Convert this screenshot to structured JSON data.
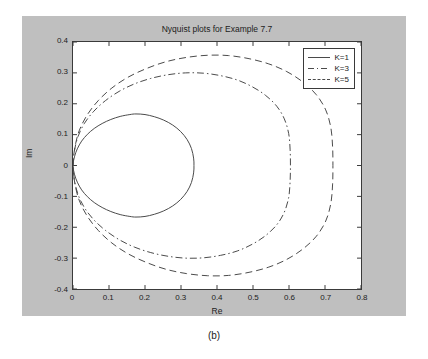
{
  "figure": {
    "caption": "(b)",
    "background_color": "#bfbfbf",
    "plot_background_color": "#ffffff"
  },
  "chart_data": {
    "type": "line",
    "title": "Nyquist plots for Example 7.7",
    "xlabel": "Re",
    "ylabel": "Im",
    "xlim": [
      0,
      0.8
    ],
    "ylim": [
      -0.4,
      0.4
    ],
    "xticks": [
      "0",
      "0.1",
      "0.2",
      "0.3",
      "0.4",
      "0.5",
      "0.6",
      "0.7",
      "0.8"
    ],
    "xtick_values": [
      0,
      0.1,
      0.2,
      0.3,
      0.4,
      0.5,
      0.6,
      0.7,
      0.8
    ],
    "yticks": [
      "0.4",
      "0.3",
      "0.2",
      "0.1",
      "0",
      "-0.1",
      "-0.2",
      "-0.3",
      "-0.4"
    ],
    "ytick_values": [
      0.4,
      0.3,
      0.2,
      0.1,
      0,
      -0.1,
      -0.2,
      -0.3,
      -0.4
    ],
    "grid": false,
    "legend_position": "top-right",
    "series": [
      {
        "name": "K=1",
        "linestyle": "solid",
        "color": "#4a4a4a",
        "max_real": 0.335,
        "peak_imag": 0.167,
        "points": [
          [
            0.0,
            0.0
          ],
          [
            0.004,
            0.028
          ],
          [
            0.012,
            0.054
          ],
          [
            0.024,
            0.079
          ],
          [
            0.04,
            0.101
          ],
          [
            0.059,
            0.12
          ],
          [
            0.081,
            0.136
          ],
          [
            0.105,
            0.149
          ],
          [
            0.131,
            0.159
          ],
          [
            0.158,
            0.165
          ],
          [
            0.175,
            0.167
          ],
          [
            0.2,
            0.165
          ],
          [
            0.226,
            0.158
          ],
          [
            0.252,
            0.147
          ],
          [
            0.277,
            0.131
          ],
          [
            0.299,
            0.11
          ],
          [
            0.317,
            0.084
          ],
          [
            0.329,
            0.055
          ],
          [
            0.335,
            0.024
          ],
          [
            0.336,
            0.0
          ],
          [
            0.335,
            -0.024
          ],
          [
            0.329,
            -0.055
          ],
          [
            0.317,
            -0.084
          ],
          [
            0.299,
            -0.11
          ],
          [
            0.277,
            -0.131
          ],
          [
            0.252,
            -0.147
          ],
          [
            0.226,
            -0.158
          ],
          [
            0.2,
            -0.165
          ],
          [
            0.175,
            -0.167
          ],
          [
            0.158,
            -0.165
          ],
          [
            0.131,
            -0.159
          ],
          [
            0.105,
            -0.149
          ],
          [
            0.081,
            -0.136
          ],
          [
            0.059,
            -0.12
          ],
          [
            0.04,
            -0.101
          ],
          [
            0.024,
            -0.079
          ],
          [
            0.012,
            -0.054
          ],
          [
            0.004,
            -0.028
          ],
          [
            0.0,
            0.0
          ]
        ]
      },
      {
        "name": "K=3",
        "linestyle": "dashdot",
        "color": "#4a4a4a",
        "max_real": 0.601,
        "peak_imag": 0.3,
        "points": [
          [
            0.0,
            0.0
          ],
          [
            0.004,
            0.048
          ],
          [
            0.014,
            0.094
          ],
          [
            0.032,
            0.137
          ],
          [
            0.058,
            0.176
          ],
          [
            0.09,
            0.21
          ],
          [
            0.128,
            0.24
          ],
          [
            0.17,
            0.264
          ],
          [
            0.216,
            0.282
          ],
          [
            0.264,
            0.294
          ],
          [
            0.313,
            0.3
          ],
          [
            0.362,
            0.299
          ],
          [
            0.41,
            0.291
          ],
          [
            0.456,
            0.277
          ],
          [
            0.498,
            0.255
          ],
          [
            0.535,
            0.227
          ],
          [
            0.566,
            0.192
          ],
          [
            0.587,
            0.151
          ],
          [
            0.599,
            0.104
          ],
          [
            0.603,
            0.053
          ],
          [
            0.604,
            0.0
          ],
          [
            0.603,
            -0.053
          ],
          [
            0.599,
            -0.104
          ],
          [
            0.587,
            -0.151
          ],
          [
            0.566,
            -0.192
          ],
          [
            0.535,
            -0.227
          ],
          [
            0.498,
            -0.255
          ],
          [
            0.456,
            -0.277
          ],
          [
            0.41,
            -0.291
          ],
          [
            0.362,
            -0.299
          ],
          [
            0.313,
            -0.3
          ],
          [
            0.264,
            -0.294
          ],
          [
            0.216,
            -0.282
          ],
          [
            0.17,
            -0.264
          ],
          [
            0.128,
            -0.24
          ],
          [
            0.09,
            -0.21
          ],
          [
            0.058,
            -0.176
          ],
          [
            0.032,
            -0.137
          ],
          [
            0.014,
            -0.094
          ],
          [
            0.004,
            -0.048
          ],
          [
            0.0,
            0.0
          ]
        ]
      },
      {
        "name": "K=5",
        "linestyle": "dashed",
        "color": "#4a4a4a",
        "max_real": 0.718,
        "peak_imag": 0.357,
        "points": [
          [
            0.0,
            0.0
          ],
          [
            0.005,
            0.057
          ],
          [
            0.017,
            0.112
          ],
          [
            0.039,
            0.163
          ],
          [
            0.07,
            0.21
          ],
          [
            0.108,
            0.251
          ],
          [
            0.153,
            0.286
          ],
          [
            0.204,
            0.314
          ],
          [
            0.258,
            0.336
          ],
          [
            0.315,
            0.35
          ],
          [
            0.374,
            0.357
          ],
          [
            0.432,
            0.356
          ],
          [
            0.489,
            0.346
          ],
          [
            0.544,
            0.329
          ],
          [
            0.594,
            0.304
          ],
          [
            0.639,
            0.27
          ],
          [
            0.676,
            0.229
          ],
          [
            0.702,
            0.18
          ],
          [
            0.716,
            0.124
          ],
          [
            0.721,
            0.063
          ],
          [
            0.722,
            0.0
          ],
          [
            0.721,
            -0.063
          ],
          [
            0.716,
            -0.124
          ],
          [
            0.702,
            -0.18
          ],
          [
            0.676,
            -0.229
          ],
          [
            0.639,
            -0.27
          ],
          [
            0.594,
            -0.304
          ],
          [
            0.544,
            -0.329
          ],
          [
            0.489,
            -0.346
          ],
          [
            0.432,
            -0.356
          ],
          [
            0.374,
            -0.357
          ],
          [
            0.315,
            -0.35
          ],
          [
            0.258,
            -0.336
          ],
          [
            0.204,
            -0.314
          ],
          [
            0.153,
            -0.286
          ],
          [
            0.108,
            -0.251
          ],
          [
            0.07,
            -0.21
          ],
          [
            0.039,
            -0.163
          ],
          [
            0.017,
            -0.112
          ],
          [
            0.005,
            -0.057
          ],
          [
            0.0,
            0.0
          ]
        ]
      }
    ]
  }
}
